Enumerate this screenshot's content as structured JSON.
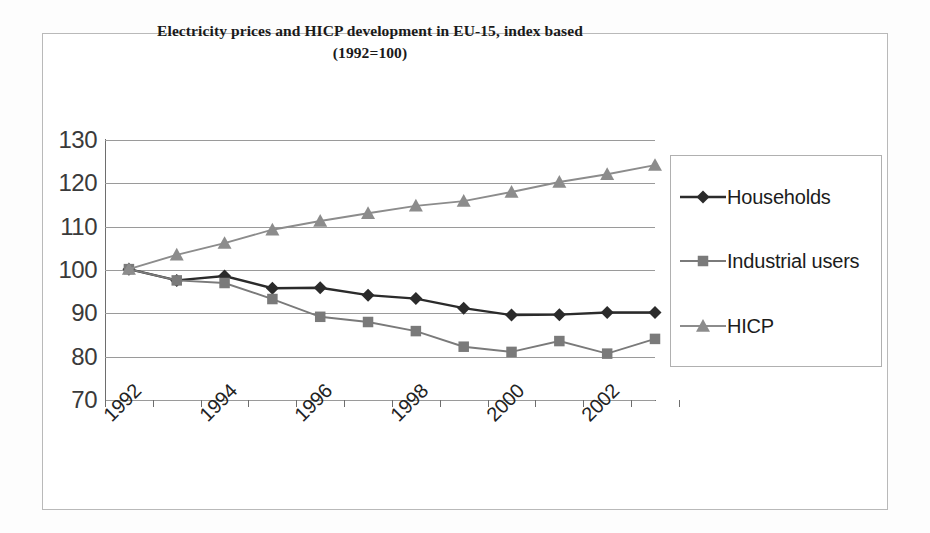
{
  "chart_data": {
    "type": "line",
    "title": "Electricity prices and HICP development in EU-15, index based",
    "subtitle": "(1992=100)",
    "xlabel": "",
    "ylabel": "",
    "xlim": [
      1992,
      2003.5
    ],
    "ylim": [
      70,
      130
    ],
    "grid": true,
    "legend_position": "right",
    "yticks": [
      130,
      120,
      110,
      100,
      90,
      80,
      70
    ],
    "xticks": [
      1992,
      1994,
      1996,
      1998,
      2000,
      2002
    ],
    "x": [
      1992.5,
      1993.5,
      1994.5,
      1995.5,
      1996.5,
      1997.5,
      1998.5,
      1999.5,
      2000.5,
      2001.5,
      2002.5,
      2003.5
    ],
    "series": [
      {
        "name": "Households",
        "marker": "diamond",
        "color": "#2b2b2b",
        "values": [
          100.2,
          97.6,
          98.6,
          95.8,
          95.9,
          94.2,
          93.4,
          91.2,
          89.6,
          89.7,
          90.2,
          90.2
        ]
      },
      {
        "name": "Industrial users",
        "marker": "square",
        "color": "#7a7a7a",
        "values": [
          100.2,
          97.6,
          97.0,
          93.3,
          89.2,
          88.0,
          85.9,
          82.3,
          81.1,
          83.6,
          80.7,
          84.1
        ]
      },
      {
        "name": "HICP",
        "marker": "triangle",
        "color": "#8c8c8c",
        "values": [
          100.2,
          103.5,
          106.2,
          109.3,
          111.3,
          113.1,
          114.8,
          115.9,
          118.0,
          120.3,
          122.1,
          124.2
        ]
      }
    ]
  },
  "chart": {
    "title_line1": "Electricity prices and HICP development in EU-15, index based",
    "title_line2": "(1992=100)"
  },
  "legend": {
    "items": [
      {
        "label": "Households"
      },
      {
        "label": "Industrial users"
      },
      {
        "label": "HICP"
      }
    ]
  },
  "colors": {
    "households": "#2b2b2b",
    "industrial_users": "#7a7a7a",
    "hicp": "#8c8c8c",
    "grid": "#9a9a9a",
    "axis": "#6e6e6e",
    "frame": "#b9b9b9"
  }
}
